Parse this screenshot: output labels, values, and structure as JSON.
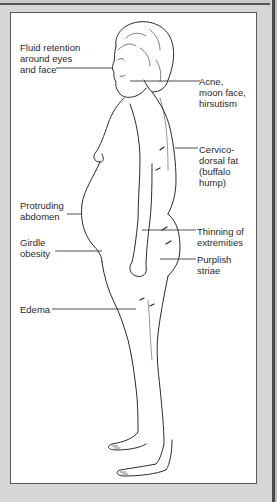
{
  "diagram": {
    "labels": [
      {
        "id": "fluid-retention",
        "text": "Fluid retention\naround eyes\nand face",
        "side": "left"
      },
      {
        "id": "acne-moon-face",
        "text": "Acne,\nmoon face,\nhirsutism",
        "side": "right"
      },
      {
        "id": "buffalo-hump",
        "text": "Cervico-\ndorsal fat\n(buffalo\nhump)",
        "side": "right"
      },
      {
        "id": "protruding-abdomen",
        "text": "Protruding\nabdomen",
        "side": "left"
      },
      {
        "id": "thinning-extremities",
        "text": "Thinning of\nextremities",
        "side": "right"
      },
      {
        "id": "girdle-obesity",
        "text": "Girdle\nobesity",
        "side": "left"
      },
      {
        "id": "purplish-striae",
        "text": "Purplish\nstriae",
        "side": "right"
      },
      {
        "id": "edema",
        "text": "Edema",
        "side": "left"
      }
    ]
  },
  "colors": {
    "background": "#d6d6d6",
    "panel": "#ffffff",
    "line": "#2a2a2a",
    "frame_dark": "#4a4a4a"
  }
}
